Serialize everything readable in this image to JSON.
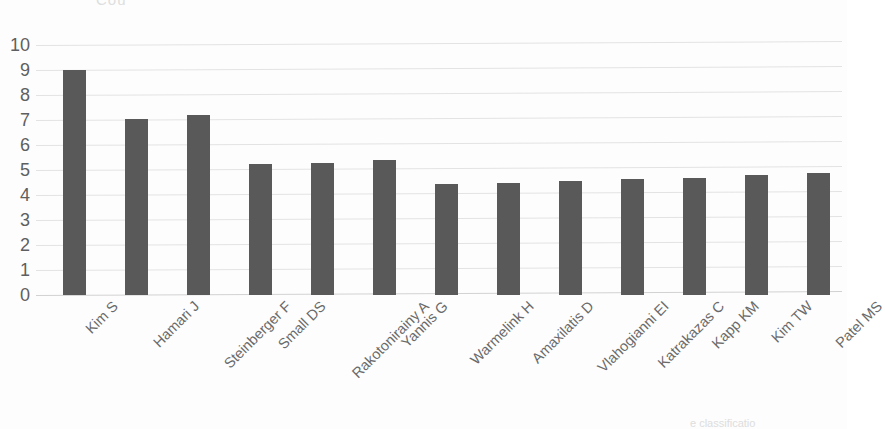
{
  "figure": {
    "clipped_title_text": "Cou",
    "clipped_caption_text": "e  classificatio",
    "bar_color": "#595959",
    "gridline_color": "#e3e3e3",
    "text_color": "#5f5f5f"
  },
  "chart_data": {
    "type": "bar",
    "title": "",
    "xlabel": "",
    "ylabel": "",
    "ylim": [
      0,
      10
    ],
    "ytick_labels": [
      "10",
      "9",
      "8",
      "7",
      "6",
      "5",
      "4",
      "3",
      "2",
      "1",
      "0"
    ],
    "ytick_values": [
      10,
      9,
      8,
      7,
      6,
      5,
      4,
      3,
      2,
      1,
      0
    ],
    "grid": true,
    "legend": false,
    "categories": [
      "Kim S",
      "Hamari J",
      "Steinberger F",
      "Small DS",
      "Rakotonirainy A",
      "Yannis G",
      "Warmelink H",
      "Amaxilatis D",
      "Vlahogianni EI",
      "Katrakazas C",
      "Kapp KM",
      "Kim TW",
      "Patel MS"
    ],
    "values": [
      9.0,
      7.05,
      7.2,
      5.25,
      5.3,
      5.4,
      4.45,
      4.5,
      4.55,
      4.65,
      4.7,
      4.8,
      4.9
    ]
  }
}
